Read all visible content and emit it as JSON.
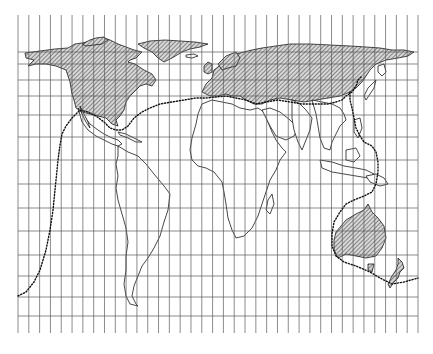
{
  "map": {
    "type": "world-map",
    "projection": "rectangular-grid",
    "style": "black-and-white line drawing",
    "colors": {
      "background": "#ffffff",
      "grid": "#5a5a5a",
      "coastline": "#1a1a1a",
      "hatch": "#333333",
      "route": "#111111"
    },
    "grid": {
      "x_start": 18,
      "x_end": 418,
      "columns": 37,
      "y_top": 15,
      "y_bottom": 333,
      "horizontal_lines": [
        52,
        64,
        80,
        96,
        115,
        137,
        160,
        184,
        208,
        231,
        255,
        276,
        297,
        316
      ]
    },
    "hatched_regions": [
      "North America (Canada and USA)",
      "Greenland",
      "Europe and Northern Asia",
      "Australia",
      "New Zealand"
    ],
    "outlined_regions": [
      "Central America",
      "South America",
      "Africa",
      "Arabian Peninsula",
      "India",
      "Southeast Asia",
      "Indonesia"
    ],
    "route": {
      "style": "dotted",
      "description": "Dotted boundary line encircling the hatched northern regions and Australia/New Zealand"
    }
  }
}
